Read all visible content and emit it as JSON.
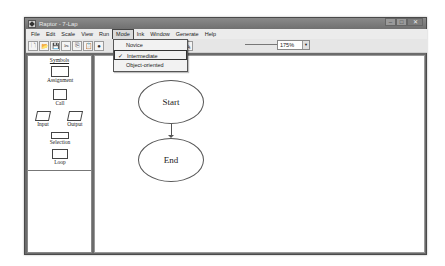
{
  "window": {
    "title": "Raptor - 7-Lap",
    "controls": {
      "minimize": "–",
      "maximize": "□",
      "close": "✕"
    }
  },
  "menubar": {
    "items": [
      {
        "label": "File"
      },
      {
        "label": "Edit"
      },
      {
        "label": "Scale"
      },
      {
        "label": "View"
      },
      {
        "label": "Run"
      },
      {
        "label": "Mode",
        "active": true
      },
      {
        "label": "Ink"
      },
      {
        "label": "Window"
      },
      {
        "label": "Generate"
      },
      {
        "label": "Help"
      }
    ]
  },
  "mode_menu": {
    "options": [
      {
        "label": "Novice",
        "checked": false
      },
      {
        "label": "Intermediate",
        "checked": true,
        "check_glyph": "✓"
      },
      {
        "label": "Object-oriented",
        "checked": false
      }
    ]
  },
  "toolbar": {
    "buttons": [
      {
        "name": "new-file",
        "glyph": "🗋"
      },
      {
        "name": "open-file",
        "glyph": "📂"
      },
      {
        "name": "save-file",
        "glyph": "💾"
      },
      {
        "name": "cut",
        "glyph": "✂"
      },
      {
        "name": "copy",
        "glyph": "⎘"
      },
      {
        "name": "paste",
        "glyph": "📋"
      },
      {
        "name": "run",
        "glyph": "●"
      }
    ],
    "right_buttons": [
      {
        "name": "step",
        "glyph": "⊣"
      },
      {
        "name": "pen",
        "glyph": "✎"
      }
    ],
    "zoom": {
      "value": "175%",
      "arrow": "▼"
    }
  },
  "palette": {
    "header": "Symbols",
    "symbols": [
      {
        "label": "Assignment"
      },
      {
        "label": "Call"
      },
      {
        "label": "Input"
      },
      {
        "label": "Output"
      },
      {
        "label": "Selection"
      },
      {
        "label": "Loop"
      }
    ]
  },
  "canvas": {
    "start_label": "Start",
    "end_label": "End"
  }
}
